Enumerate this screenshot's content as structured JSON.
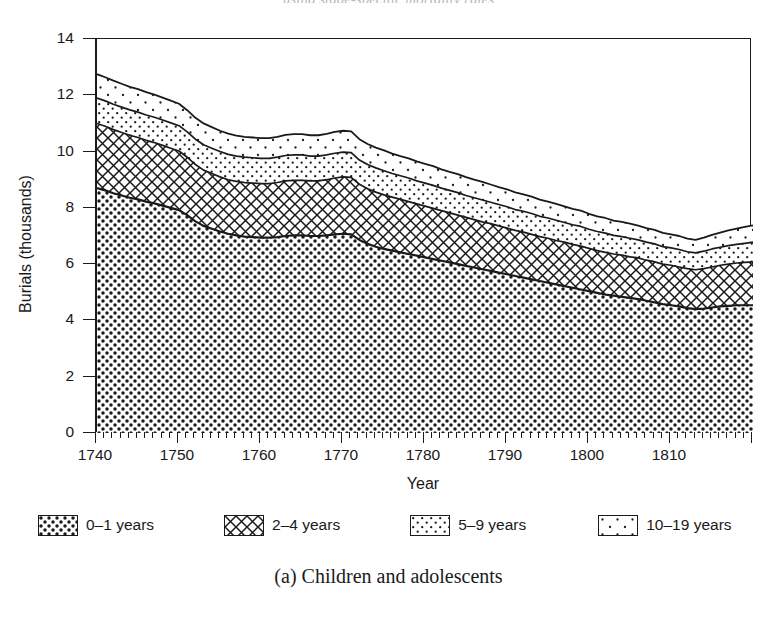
{
  "figure": {
    "caption": "(a) Children and adolescents",
    "running_head_ghost": "using stage-specific mortality rates"
  },
  "chart_data": {
    "type": "area",
    "stacked": true,
    "title": "",
    "xlabel": "Year",
    "ylabel": "Burials (thousands)",
    "xlim": [
      1740,
      1820
    ],
    "ylim": [
      0,
      14
    ],
    "ytick_labels": [
      "14",
      "12",
      "10",
      "8",
      "6",
      "4",
      "2",
      "0"
    ],
    "yticks": [
      14,
      12,
      10,
      8,
      6,
      4,
      2,
      0
    ],
    "xtick_labels": [
      "1740",
      "1750",
      "1760",
      "1770",
      "1780",
      "1790",
      "1800",
      "1810"
    ],
    "xticks": [
      1740,
      1750,
      1760,
      1770,
      1780,
      1790,
      1800,
      1810
    ],
    "minor_xtick_step": 1,
    "grid": false,
    "legend_position": "below-plot",
    "x": [
      1740,
      1741,
      1742,
      1743,
      1744,
      1745,
      1746,
      1747,
      1748,
      1749,
      1750,
      1751,
      1752,
      1753,
      1754,
      1755,
      1756,
      1757,
      1758,
      1759,
      1760,
      1761,
      1762,
      1763,
      1764,
      1765,
      1766,
      1767,
      1768,
      1769,
      1770,
      1771,
      1772,
      1773,
      1774,
      1775,
      1776,
      1777,
      1778,
      1779,
      1780,
      1781,
      1782,
      1783,
      1784,
      1785,
      1786,
      1787,
      1788,
      1789,
      1790,
      1791,
      1792,
      1793,
      1794,
      1795,
      1796,
      1797,
      1798,
      1799,
      1800,
      1801,
      1802,
      1803,
      1804,
      1805,
      1806,
      1807,
      1808,
      1809,
      1810,
      1811,
      1812,
      1813,
      1814,
      1815,
      1816,
      1817,
      1818,
      1819,
      1820
    ],
    "series": [
      {
        "name": "0–1 years",
        "pattern": "dense-checker",
        "values": [
          8.7,
          8.62,
          8.52,
          8.44,
          8.36,
          8.3,
          8.22,
          8.16,
          8.08,
          8.0,
          7.92,
          7.74,
          7.52,
          7.36,
          7.26,
          7.16,
          7.08,
          7.02,
          6.98,
          6.96,
          6.94,
          6.94,
          6.96,
          7.0,
          7.02,
          7.02,
          7.0,
          7.0,
          7.02,
          7.06,
          7.08,
          7.06,
          6.86,
          6.72,
          6.62,
          6.54,
          6.48,
          6.42,
          6.36,
          6.3,
          6.24,
          6.18,
          6.12,
          6.06,
          6.0,
          5.94,
          5.88,
          5.82,
          5.76,
          5.7,
          5.64,
          5.58,
          5.52,
          5.46,
          5.4,
          5.34,
          5.28,
          5.22,
          5.16,
          5.1,
          5.04,
          4.98,
          4.92,
          4.88,
          4.84,
          4.8,
          4.76,
          4.7,
          4.64,
          4.58,
          4.54,
          4.5,
          4.44,
          4.4,
          4.42,
          4.46,
          4.5,
          4.52,
          4.54,
          4.54,
          4.54
        ]
      },
      {
        "name": "2–4 years",
        "pattern": "cross-hatch",
        "values": [
          2.3,
          2.28,
          2.26,
          2.24,
          2.22,
          2.2,
          2.18,
          2.16,
          2.14,
          2.12,
          2.1,
          2.06,
          2.02,
          1.98,
          1.96,
          1.94,
          1.92,
          1.92,
          1.92,
          1.92,
          1.92,
          1.92,
          1.94,
          1.96,
          1.96,
          1.96,
          1.96,
          1.96,
          1.98,
          2.0,
          2.02,
          2.02,
          1.98,
          1.96,
          1.94,
          1.92,
          1.9,
          1.88,
          1.86,
          1.84,
          1.82,
          1.8,
          1.78,
          1.76,
          1.74,
          1.72,
          1.7,
          1.68,
          1.68,
          1.66,
          1.64,
          1.62,
          1.62,
          1.6,
          1.58,
          1.58,
          1.56,
          1.56,
          1.54,
          1.54,
          1.52,
          1.5,
          1.5,
          1.48,
          1.48,
          1.46,
          1.46,
          1.44,
          1.44,
          1.42,
          1.42,
          1.4,
          1.4,
          1.4,
          1.42,
          1.44,
          1.46,
          1.48,
          1.5,
          1.52,
          1.54
        ]
      },
      {
        "name": "5–9 years",
        "pattern": "dense-dots",
        "values": [
          0.9,
          0.9,
          0.9,
          0.9,
          0.9,
          0.9,
          0.9,
          0.9,
          0.9,
          0.9,
          0.9,
          0.9,
          0.9,
          0.9,
          0.9,
          0.9,
          0.9,
          0.9,
          0.9,
          0.9,
          0.9,
          0.9,
          0.9,
          0.9,
          0.9,
          0.9,
          0.88,
          0.88,
          0.88,
          0.88,
          0.88,
          0.88,
          0.86,
          0.86,
          0.86,
          0.86,
          0.84,
          0.84,
          0.84,
          0.82,
          0.82,
          0.82,
          0.8,
          0.8,
          0.8,
          0.78,
          0.78,
          0.78,
          0.76,
          0.76,
          0.76,
          0.74,
          0.74,
          0.74,
          0.72,
          0.72,
          0.72,
          0.7,
          0.7,
          0.7,
          0.68,
          0.68,
          0.68,
          0.66,
          0.66,
          0.66,
          0.64,
          0.64,
          0.64,
          0.62,
          0.62,
          0.62,
          0.6,
          0.6,
          0.62,
          0.64,
          0.64,
          0.66,
          0.66,
          0.68,
          0.7
        ]
      },
      {
        "name": "10–19 years",
        "pattern": "sparse-dots",
        "values": [
          0.85,
          0.84,
          0.84,
          0.83,
          0.82,
          0.82,
          0.81,
          0.8,
          0.8,
          0.79,
          0.78,
          0.77,
          0.76,
          0.76,
          0.75,
          0.74,
          0.74,
          0.73,
          0.72,
          0.72,
          0.72,
          0.72,
          0.72,
          0.73,
          0.74,
          0.74,
          0.74,
          0.74,
          0.75,
          0.76,
          0.76,
          0.76,
          0.74,
          0.73,
          0.72,
          0.72,
          0.71,
          0.7,
          0.7,
          0.69,
          0.68,
          0.68,
          0.67,
          0.66,
          0.66,
          0.65,
          0.64,
          0.64,
          0.63,
          0.62,
          0.62,
          0.61,
          0.6,
          0.6,
          0.59,
          0.58,
          0.58,
          0.57,
          0.56,
          0.56,
          0.55,
          0.54,
          0.54,
          0.53,
          0.52,
          0.52,
          0.51,
          0.5,
          0.5,
          0.49,
          0.48,
          0.48,
          0.47,
          0.46,
          0.48,
          0.5,
          0.52,
          0.54,
          0.56,
          0.58,
          0.6
        ]
      }
    ],
    "totals_note": "stack top ≈ 12.75 at 1740, ≈ 9.9 at 1771, ≈ 7.8 at 1813, ≈ 8.2 at 1820"
  },
  "legend": {
    "items": [
      {
        "label": "0–1 years",
        "pattern": "dense-checker"
      },
      {
        "label": "2–4 years",
        "pattern": "cross-hatch"
      },
      {
        "label": "5–9 years",
        "pattern": "dense-dots"
      },
      {
        "label": "10–19 years",
        "pattern": "sparse-dots"
      }
    ]
  },
  "colors": {
    "ink": "#1a1a1a",
    "paper": "#ffffff"
  }
}
